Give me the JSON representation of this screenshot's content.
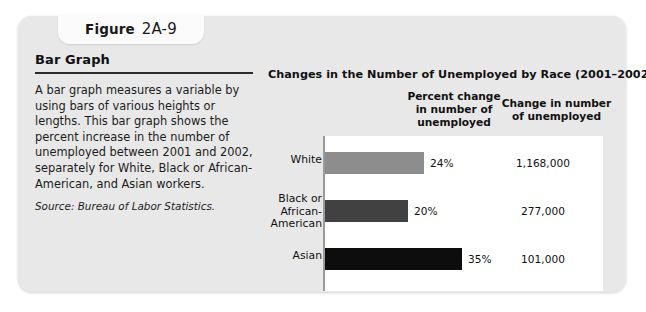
{
  "figure": {
    "tab_word": "Figure",
    "tab_number": "2A-9",
    "heading": "Bar Graph",
    "body": "A bar graph measures a variable by using bars of various heights or lengths. This bar graph shows the percent increase in the number of unemployed between 2001 and 2002, separately for White, Black or African-American, and Asian workers.",
    "source": "Source: Bureau of Labor Statistics."
  },
  "chart_data": {
    "type": "bar",
    "title": "Changes in the Number of Unemployed by Race (2001–2002)",
    "orientation": "horizontal",
    "xlabel": "",
    "ylabel": "",
    "grid": false,
    "legend": "none",
    "columns": [
      "Percent change in number of unemployed",
      "Change in number of unemployed"
    ],
    "column_headers": {
      "percent_change": "Percent change\nin number of\nunemployed",
      "change_in_number": "Change in number\nof unemployed"
    },
    "categories": [
      "White",
      "Black or African-American",
      "Asian"
    ],
    "category_labels": [
      "White",
      "Black or\nAfrican-\nAmerican",
      "Asian"
    ],
    "values": [
      24,
      20,
      35
    ],
    "value_labels": [
      "24%",
      "20%",
      "35%"
    ],
    "secondary_values": [
      1168000,
      277000,
      101000
    ],
    "secondary_labels": [
      "1,168,000",
      "277,000",
      "101,000"
    ],
    "bar_colors": [
      "#8d8d8d",
      "#414141",
      "#0d0d0d"
    ],
    "xlim": [
      0,
      40
    ]
  },
  "colors": {
    "card_background": "#e8e8e8",
    "tab_background": "#fbfbfb",
    "plot_background": "#ffffff",
    "rule": "#2b2b2b",
    "axis": "#9a9a9a",
    "text": "#111111"
  }
}
